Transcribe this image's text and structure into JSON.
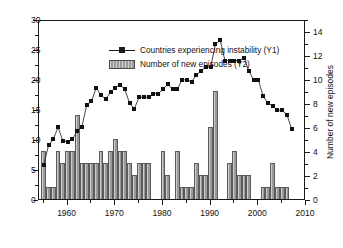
{
  "chart_data": {
    "type": "bar",
    "title": "",
    "xlabel": "",
    "ylabel": "Percent of countries experiencing instability (%)",
    "y2label": "Number of new episodes",
    "xlim": [
      1954,
      2010
    ],
    "ylim": [
      0,
      30
    ],
    "y2lim": [
      0,
      15
    ],
    "xticks": [
      1960,
      1970,
      1980,
      1990,
      2000,
      2010
    ],
    "xtick_labels": [
      "1960",
      "1970",
      "1980",
      "1990",
      "2000",
      "2010"
    ],
    "yticks": [
      0,
      5,
      10,
      15,
      20,
      25,
      30
    ],
    "ytick_labels": [
      "0",
      "5",
      "10",
      "15",
      "20",
      "25",
      "30"
    ],
    "y2ticks": [
      0,
      2,
      4,
      6,
      8,
      10,
      12,
      14
    ],
    "y2tick_labels": [
      "0",
      "2",
      "4",
      "6",
      "8",
      "10",
      "12",
      "14"
    ],
    "grid": false,
    "legend_position": "top-left",
    "legend": [
      {
        "label": "Countries experiencing instability (Y1)",
        "marker": "line-square",
        "axis": "Y1"
      },
      {
        "label": "Number of new episodes (Y2)",
        "marker": "bar-swatch",
        "axis": "Y2"
      }
    ],
    "series": [
      {
        "name": "Countries experiencing instability (Y1)",
        "axis": "Y1",
        "type": "line",
        "x": [
          1955,
          1956,
          1957,
          1958,
          1959,
          1960,
          1961,
          1962,
          1963,
          1964,
          1965,
          1966,
          1967,
          1968,
          1969,
          1970,
          1971,
          1972,
          1973,
          1974,
          1975,
          1976,
          1977,
          1978,
          1979,
          1980,
          1981,
          1982,
          1983,
          1984,
          1985,
          1986,
          1987,
          1988,
          1989,
          1990,
          1991,
          1992,
          1993,
          1994,
          1995,
          1996,
          1997,
          1998,
          1999,
          2000,
          2001,
          2002,
          2003,
          2004,
          2005,
          2006,
          2007
        ],
        "values": [
          6.0,
          9.3,
          10.3,
          12.3,
          10.0,
          9.9,
          10.3,
          11.6,
          12.4,
          16.0,
          16.6,
          18.9,
          17.6,
          17.0,
          18.1,
          18.9,
          19.4,
          18.6,
          16.3,
          15.4,
          17.3,
          17.3,
          17.3,
          17.9,
          17.9,
          18.6,
          19.5,
          18.6,
          18.6,
          20.2,
          20.2,
          19.9,
          21.0,
          21.7,
          22.3,
          22.3,
          26.1,
          26.8,
          23.4,
          23.4,
          23.4,
          23.4,
          23.9,
          21.7,
          20.2,
          20.2,
          17.5,
          16.3,
          15.9,
          15.1,
          15.1,
          14.4,
          12.0
        ]
      },
      {
        "name": "Number of new episodes (Y2)",
        "axis": "Y2",
        "type": "bar",
        "x": [
          1955,
          1956,
          1957,
          1958,
          1959,
          1960,
          1961,
          1962,
          1963,
          1964,
          1965,
          1966,
          1967,
          1968,
          1969,
          1970,
          1971,
          1972,
          1973,
          1974,
          1975,
          1976,
          1977,
          1978,
          1979,
          1980,
          1981,
          1982,
          1983,
          1984,
          1985,
          1986,
          1987,
          1988,
          1989,
          1990,
          1991,
          1992,
          1993,
          1994,
          1995,
          1996,
          1997,
          1998,
          1999,
          2000,
          2001,
          2002,
          2003,
          2004,
          2005,
          2006,
          2007
        ],
        "values": [
          4,
          1,
          1,
          4,
          3,
          4,
          4,
          7,
          3,
          3,
          3,
          3,
          4,
          3,
          4,
          5,
          4,
          4,
          3,
          2,
          3,
          3,
          3,
          0,
          0,
          4,
          2,
          0,
          4,
          1,
          1,
          1,
          3,
          2,
          2,
          6,
          9,
          0,
          0,
          3,
          4,
          2,
          2,
          2,
          0,
          0,
          1,
          1,
          3,
          1,
          1,
          1,
          0
        ]
      }
    ]
  }
}
